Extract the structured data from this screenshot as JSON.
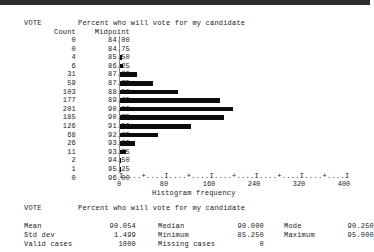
{
  "window": {
    "titlebar_color": "#2b2b2b"
  },
  "histogram_report": {
    "variable": "VOTE",
    "variable_label": "Percent who will vote for my candidate",
    "column_headers": {
      "count": "Count",
      "midpoint": "Midpoint"
    },
    "axis_title": "Histogram frequency",
    "axis_ruler": "I....+....I....+....I....+....I....+....I....+....I",
    "tick_labels": [
      "0",
      "80",
      "160",
      "240",
      "320",
      "400"
    ]
  },
  "chart_data": {
    "type": "bar",
    "orientation": "horizontal",
    "title": "Percent who will vote for my candidate",
    "xlabel": "Histogram frequency",
    "ylabel": "Midpoint",
    "xlim": [
      0,
      400
    ],
    "xticks": [
      0,
      80,
      160,
      240,
      320,
      400
    ],
    "grid": false,
    "legend": false,
    "categories": [
      "84.00",
      "84.75",
      "85.50",
      "86.25",
      "87.00",
      "87.75",
      "88.50",
      "89.25",
      "90.00",
      "90.75",
      "91.50",
      "92.25",
      "93.00",
      "93.75",
      "94.50",
      "95.25",
      "96.00"
    ],
    "values": [
      0,
      0,
      4,
      6,
      31,
      59,
      103,
      177,
      201,
      185,
      126,
      68,
      26,
      11,
      2,
      1,
      0
    ],
    "rows": [
      {
        "count": "0",
        "midpoint": "84.00",
        "value": 0
      },
      {
        "count": "0",
        "midpoint": "84.75",
        "value": 0
      },
      {
        "count": "4",
        "midpoint": "85.50",
        "value": 4
      },
      {
        "count": "6",
        "midpoint": "86.25",
        "value": 6
      },
      {
        "count": "31",
        "midpoint": "87.00",
        "value": 31
      },
      {
        "count": "59",
        "midpoint": "87.75",
        "value": 59
      },
      {
        "count": "103",
        "midpoint": "88.50",
        "value": 103
      },
      {
        "count": "177",
        "midpoint": "89.25",
        "value": 177
      },
      {
        "count": "201",
        "midpoint": "90.00",
        "value": 201
      },
      {
        "count": "185",
        "midpoint": "90.75",
        "value": 185
      },
      {
        "count": "126",
        "midpoint": "91.50",
        "value": 126
      },
      {
        "count": "68",
        "midpoint": "92.25",
        "value": 68
      },
      {
        "count": "26",
        "midpoint": "93.00",
        "value": 26
      },
      {
        "count": "11",
        "midpoint": "93.75",
        "value": 11
      },
      {
        "count": "2",
        "midpoint": "94.50",
        "value": 2
      },
      {
        "count": "1",
        "midpoint": "95.25",
        "value": 1
      },
      {
        "count": "0",
        "midpoint": "96.00",
        "value": 0
      }
    ]
  },
  "statistics_report": {
    "variable": "VOTE",
    "variable_label": "Percent who will vote for my candidate",
    "rows": [
      {
        "c1_label": "Mean",
        "c1_value": "90.054",
        "c2_label": "Median",
        "c2_value": "90.000",
        "c3_label": "Mode",
        "c3_value": "90.250"
      },
      {
        "c1_label": "Std dev",
        "c1_value": "1.499",
        "c2_label": "Minimum",
        "c2_value": "85.250",
        "c3_label": "Maximum",
        "c3_value": "95.000"
      },
      {
        "c1_label": "Valid cases",
        "c1_value": "1000",
        "c2_label": "Missing cases",
        "c2_value": "0",
        "c3_label": "",
        "c3_value": ""
      }
    ]
  }
}
